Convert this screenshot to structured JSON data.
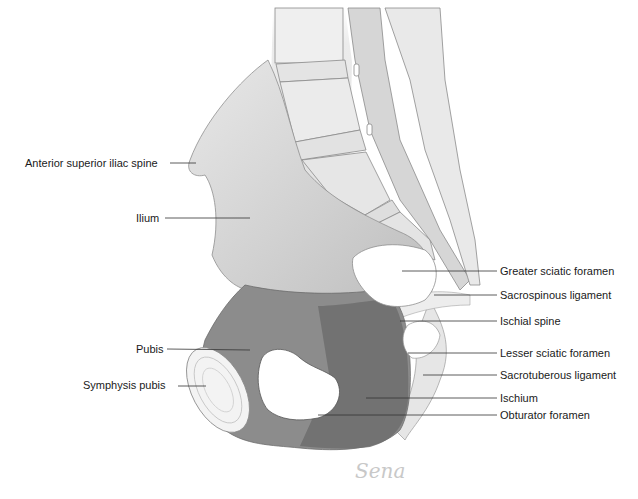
{
  "diagram": {
    "signature": "Sena",
    "colors": {
      "bone_light": "#e2e2e2",
      "ilium": "#c9c9c9",
      "pubis": "#8a8a8a",
      "ischium": "#6f6f6f",
      "leader_line": "#333333",
      "text": "#1a1a1a"
    },
    "labels_left": [
      {
        "text": "Anterior superior iliac spine",
        "x": 25,
        "y": 157,
        "line": [
          170,
          163,
          196,
          163
        ]
      },
      {
        "text": "Ilium",
        "x": 136,
        "y": 212,
        "line": [
          165,
          218,
          250,
          218
        ]
      },
      {
        "text": "Pubis",
        "x": 136,
        "y": 343,
        "line": [
          167,
          349,
          250,
          350
        ]
      },
      {
        "text": "Symphysis pubis",
        "x": 83,
        "y": 379,
        "line": [
          178,
          386,
          206,
          386
        ]
      }
    ],
    "labels_right": [
      {
        "text": "Greater sciatic foramen",
        "x": 500,
        "y": 265,
        "line": [
          402,
          271,
          497,
          271
        ]
      },
      {
        "text": "Sacrospinous ligament",
        "x": 500,
        "y": 289,
        "line": [
          434,
          295,
          497,
          295
        ]
      },
      {
        "text": "Ischial spine",
        "x": 500,
        "y": 315,
        "line": [
          400,
          321,
          497,
          321
        ]
      },
      {
        "text": "Lesser sciatic foramen",
        "x": 500,
        "y": 347,
        "line": [
          408,
          353,
          497,
          353
        ]
      },
      {
        "text": "Sacrotuberous ligament",
        "x": 500,
        "y": 369,
        "line": [
          423,
          375,
          497,
          375
        ]
      },
      {
        "text": "Ischium",
        "x": 500,
        "y": 392,
        "line": [
          366,
          398,
          497,
          398
        ]
      },
      {
        "text": "Obturator foramen",
        "x": 500,
        "y": 409,
        "line": [
          318,
          415,
          497,
          415
        ]
      }
    ]
  }
}
